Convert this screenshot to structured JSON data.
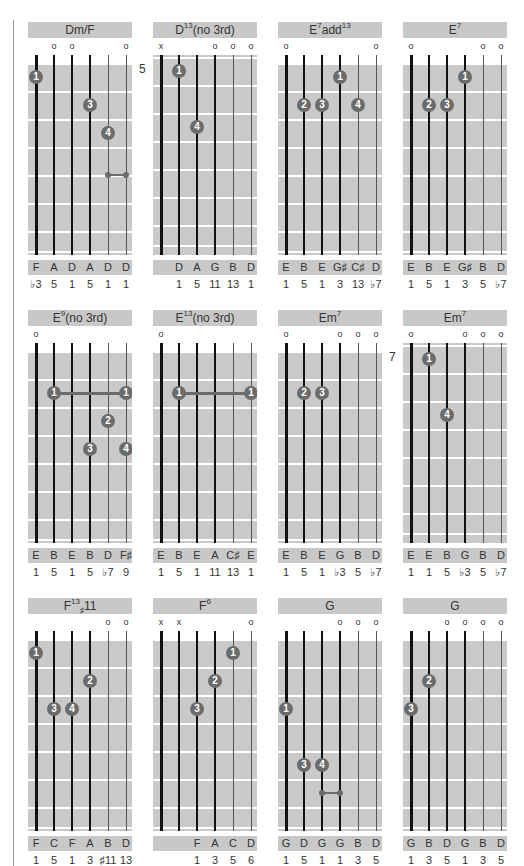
{
  "page": {
    "accent_gray": "#c8c8c8",
    "dot_color": "#6b6b6b"
  },
  "chords": [
    {
      "name": "Dm/F",
      "base": "Dm/F",
      "sup": "",
      "tail": "",
      "fret_label": "",
      "open_nut": true,
      "markers": [
        "",
        "o",
        "o",
        "",
        "",
        "o"
      ],
      "dots": [
        {
          "s": 0,
          "f": 1,
          "n": "1"
        },
        {
          "s": 3,
          "f": 2,
          "n": "3"
        },
        {
          "s": 4,
          "f": 3,
          "n": "4"
        }
      ],
      "barres": [],
      "small_barres": [
        {
          "from": 4,
          "to": 5,
          "f": 4.5
        }
      ],
      "notes": [
        "F",
        "A",
        "D",
        "A",
        "D",
        "D"
      ],
      "degrees": [
        "♭3",
        "5",
        "1",
        "5",
        "1",
        "1"
      ]
    },
    {
      "name": "D13(no 3rd)",
      "base": "D",
      "sup": "13",
      "tail": "(no 3rd)",
      "fret_label": "5",
      "open_nut": false,
      "markers": [
        "x",
        "",
        "",
        "o",
        "o",
        "o"
      ],
      "dots": [
        {
          "s": 1,
          "f": 1,
          "n": "1"
        },
        {
          "s": 2,
          "f": 3,
          "n": "4"
        }
      ],
      "barres": [],
      "small_barres": [],
      "notes": [
        "",
        "D",
        "A",
        "G",
        "B",
        "D"
      ],
      "degrees": [
        "",
        "1",
        "5",
        "11",
        "13",
        "1"
      ]
    },
    {
      "name": "E7add13",
      "base": "E",
      "sup": "7",
      "tail": "add",
      "tail_sup": "13",
      "fret_label": "",
      "open_nut": true,
      "markers": [
        "o",
        "",
        "",
        "",
        "",
        "o"
      ],
      "dots": [
        {
          "s": 3,
          "f": 1,
          "n": "1"
        },
        {
          "s": 1,
          "f": 2,
          "n": "2"
        },
        {
          "s": 2,
          "f": 2,
          "n": "3"
        },
        {
          "s": 4,
          "f": 2,
          "n": "4"
        }
      ],
      "barres": [],
      "small_barres": [],
      "notes": [
        "E",
        "B",
        "E",
        "G♯",
        "C♯",
        "D"
      ],
      "degrees": [
        "1",
        "5",
        "1",
        "3",
        "13",
        "♭7"
      ]
    },
    {
      "name": "E7",
      "base": "E",
      "sup": "7",
      "tail": "",
      "fret_label": "",
      "open_nut": true,
      "markers": [
        "o",
        "",
        "",
        "",
        "o",
        "o"
      ],
      "dots": [
        {
          "s": 3,
          "f": 1,
          "n": "1"
        },
        {
          "s": 1,
          "f": 2,
          "n": "2"
        },
        {
          "s": 2,
          "f": 2,
          "n": "3"
        }
      ],
      "barres": [],
      "small_barres": [],
      "notes": [
        "E",
        "B",
        "E",
        "G♯",
        "B",
        "D"
      ],
      "degrees": [
        "1",
        "5",
        "1",
        "3",
        "5",
        "♭7"
      ]
    },
    {
      "name": "E9(no 3rd)",
      "base": "E",
      "sup": "9",
      "tail": "(no 3rd)",
      "fret_label": "",
      "open_nut": true,
      "markers": [
        "o",
        "",
        "",
        "",
        "",
        ""
      ],
      "dots": [
        {
          "s": 1,
          "f": 2,
          "n": "1"
        },
        {
          "s": 5,
          "f": 2,
          "n": "1"
        },
        {
          "s": 4,
          "f": 3,
          "n": "2"
        },
        {
          "s": 3,
          "f": 4,
          "n": "3"
        },
        {
          "s": 5,
          "f": 4,
          "n": "4"
        }
      ],
      "barres": [
        {
          "from": 1,
          "to": 5,
          "f": 2
        }
      ],
      "small_barres": [],
      "notes": [
        "E",
        "B",
        "E",
        "B",
        "D",
        "F♯"
      ],
      "degrees": [
        "1",
        "5",
        "1",
        "5",
        "♭7",
        "9"
      ]
    },
    {
      "name": "E13(no 3rd)",
      "base": "E",
      "sup": "13",
      "tail": "(no 3rd)",
      "fret_label": "",
      "open_nut": true,
      "markers": [
        "o",
        "",
        "",
        "",
        "",
        ""
      ],
      "dots": [
        {
          "s": 1,
          "f": 2,
          "n": "1"
        },
        {
          "s": 5,
          "f": 2,
          "n": "1"
        }
      ],
      "barres": [
        {
          "from": 1,
          "to": 5,
          "f": 2
        }
      ],
      "small_barres": [],
      "notes": [
        "E",
        "B",
        "E",
        "A",
        "C♯",
        "E"
      ],
      "degrees": [
        "1",
        "5",
        "1",
        "11",
        "13",
        "1"
      ]
    },
    {
      "name": "Em7",
      "base": "Em",
      "sup": "7",
      "tail": "",
      "fret_label": "",
      "open_nut": true,
      "markers": [
        "o",
        "",
        "",
        "o",
        "o",
        "o"
      ],
      "dots": [
        {
          "s": 1,
          "f": 2,
          "n": "2"
        },
        {
          "s": 2,
          "f": 2,
          "n": "3"
        }
      ],
      "barres": [],
      "small_barres": [],
      "notes": [
        "E",
        "B",
        "E",
        "G",
        "B",
        "D"
      ],
      "degrees": [
        "1",
        "5",
        "1",
        "♭3",
        "5",
        "♭7"
      ]
    },
    {
      "name": "Em7",
      "base": "Em",
      "sup": "7",
      "tail": "",
      "fret_label": "7",
      "open_nut": false,
      "markers": [
        "o",
        "",
        "",
        "o",
        "o",
        "o"
      ],
      "dots": [
        {
          "s": 1,
          "f": 1,
          "n": "1"
        },
        {
          "s": 2,
          "f": 3,
          "n": "4"
        }
      ],
      "barres": [],
      "small_barres": [],
      "notes": [
        "E",
        "E",
        "B",
        "G",
        "B",
        "D"
      ],
      "degrees": [
        "1",
        "1",
        "5",
        "♭3",
        "5",
        "♭7"
      ]
    },
    {
      "name": "F13♯11",
      "base": "F",
      "sup": "13",
      "sub": "♯",
      "tail": "11",
      "fret_label": "",
      "open_nut": true,
      "markers": [
        "",
        "",
        "",
        "",
        "o",
        "o"
      ],
      "dots": [
        {
          "s": 0,
          "f": 1,
          "n": "1"
        },
        {
          "s": 3,
          "f": 2,
          "n": "2"
        },
        {
          "s": 1,
          "f": 3,
          "n": "3"
        },
        {
          "s": 2,
          "f": 3,
          "n": "4"
        }
      ],
      "barres": [],
      "small_barres": [],
      "notes": [
        "F",
        "C",
        "F",
        "A",
        "B",
        "D"
      ],
      "degrees": [
        "1",
        "5",
        "1",
        "3",
        "♯11",
        "13"
      ]
    },
    {
      "name": "F6",
      "base": "F",
      "sup": "6",
      "tail": "",
      "fret_label": "",
      "open_nut": true,
      "markers": [
        "x",
        "x",
        "",
        "",
        "",
        "o"
      ],
      "dots": [
        {
          "s": 4,
          "f": 1,
          "n": "1"
        },
        {
          "s": 3,
          "f": 2,
          "n": "2"
        },
        {
          "s": 2,
          "f": 3,
          "n": "3"
        }
      ],
      "barres": [],
      "small_barres": [],
      "notes": [
        "",
        "",
        "F",
        "A",
        "C",
        "D"
      ],
      "degrees": [
        "",
        "",
        "1",
        "3",
        "5",
        "6"
      ]
    },
    {
      "name": "G",
      "base": "G",
      "sup": "",
      "tail": "",
      "fret_label": "",
      "open_nut": true,
      "markers": [
        "",
        "",
        "",
        "o",
        "o",
        "o"
      ],
      "dots": [
        {
          "s": 0,
          "f": 3,
          "n": "1"
        },
        {
          "s": 1,
          "f": 5,
          "n": "3"
        },
        {
          "s": 2,
          "f": 5,
          "n": "4"
        }
      ],
      "barres": [],
      "small_barres": [
        {
          "from": 2,
          "to": 3,
          "f": 6
        }
      ],
      "notes": [
        "G",
        "D",
        "G",
        "G",
        "B",
        "D"
      ],
      "degrees": [
        "1",
        "5",
        "1",
        "1",
        "3",
        "5"
      ]
    },
    {
      "name": "G",
      "base": "G",
      "sup": "",
      "tail": "",
      "fret_label": "",
      "open_nut": true,
      "markers": [
        "",
        "",
        "o",
        "o",
        "o",
        "o"
      ],
      "dots": [
        {
          "s": 1,
          "f": 2,
          "n": "2"
        },
        {
          "s": 0,
          "f": 3,
          "n": "3"
        }
      ],
      "barres": [],
      "small_barres": [],
      "notes": [
        "G",
        "B",
        "D",
        "G",
        "B",
        "D"
      ],
      "degrees": [
        "1",
        "3",
        "5",
        "1",
        "3",
        "5"
      ]
    }
  ]
}
